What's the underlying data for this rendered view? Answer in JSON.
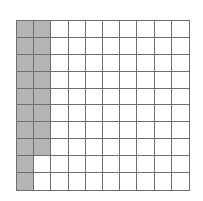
{
  "diagram": {
    "type": "hundred-grid",
    "rows": 10,
    "columns": 10,
    "total_cells": 100,
    "shaded_count": 18,
    "shaded_cells": {
      "column_1": [
        1,
        2,
        3,
        4,
        5,
        6,
        7,
        8,
        9,
        10
      ],
      "column_2": [
        1,
        2,
        3,
        4,
        5,
        6,
        7,
        8
      ]
    },
    "colors": {
      "shaded": "#b4b4b4",
      "unshaded": "#ffffff",
      "grid_line": "#6e6e6e"
    }
  }
}
